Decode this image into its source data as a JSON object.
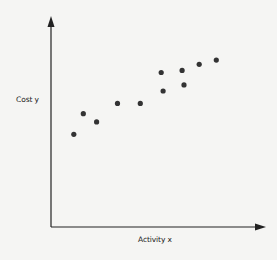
{
  "chart_data": {
    "type": "scatter",
    "title": "",
    "xlabel": "Activity x",
    "ylabel": "Cost y",
    "grid": false,
    "legend": null,
    "xlim": [
      0,
      100
    ],
    "ylim": [
      0,
      100
    ],
    "x_ticks": [],
    "y_ticks": [],
    "points": [
      {
        "x": 12,
        "y": 45
      },
      {
        "x": 17,
        "y": 55
      },
      {
        "x": 24,
        "y": 51
      },
      {
        "x": 35,
        "y": 60
      },
      {
        "x": 47,
        "y": 60
      },
      {
        "x": 58,
        "y": 75
      },
      {
        "x": 59,
        "y": 66
      },
      {
        "x": 69,
        "y": 76
      },
      {
        "x": 70,
        "y": 69
      },
      {
        "x": 78,
        "y": 79
      },
      {
        "x": 87,
        "y": 81
      }
    ],
    "point_color": "#333333",
    "axis_color": "#222222"
  },
  "labels": {
    "x_axis": "Activity x",
    "y_axis": "Cost y"
  }
}
